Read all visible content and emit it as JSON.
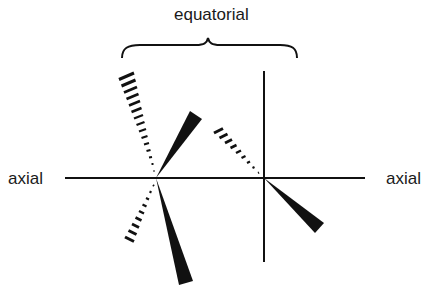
{
  "labels": {
    "top": "equatorial",
    "left": "axial",
    "right": "axial"
  },
  "colors": {
    "ink": "#111111",
    "background": "#ffffff"
  },
  "geometry": {
    "axis_y": 178,
    "axis_x_start": 65,
    "axis_x_end": 365,
    "left_center": [
      156,
      178
    ],
    "right_center": [
      264,
      178
    ],
    "right_vertical": {
      "x": 264,
      "y_start": 71,
      "y_end": 262
    }
  },
  "bonds": {
    "left_center": [
      {
        "type": "wedge",
        "to": [
          196,
          115
        ]
      },
      {
        "type": "wedge",
        "to": [
          186,
          283
        ]
      },
      {
        "type": "hash",
        "to": [
          126,
          75
        ]
      },
      {
        "type": "hash",
        "to": [
          122,
          240
        ]
      }
    ],
    "right_center": [
      {
        "type": "wedge",
        "to": [
          320,
          228
        ]
      },
      {
        "type": "hash",
        "to": [
          215,
          130
        ]
      }
    ]
  }
}
